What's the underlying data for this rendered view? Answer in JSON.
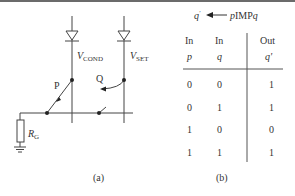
{
  "figure": {
    "panel_a": {
      "caption": "(a)",
      "labels": {
        "v_cond_main": "V",
        "v_cond_sub": "COND",
        "v_set_main": "V",
        "v_set_sub": "SET",
        "switch_p": "P",
        "switch_q": "Q",
        "resistor_main": "R",
        "resistor_sub": "G"
      }
    },
    "panel_b": {
      "caption": "(b)",
      "title": {
        "output": "q",
        "output_prime": "'",
        "expr_p": "p",
        "expr_op": "IMP",
        "expr_sub": "q"
      },
      "headers": [
        {
          "top": "In",
          "bottom": "p"
        },
        {
          "top": "In",
          "bottom": "q"
        },
        {
          "top": "Out",
          "bottom": "q'"
        }
      ],
      "rows": [
        [
          "0",
          "0",
          "1"
        ],
        [
          "0",
          "1",
          "1"
        ],
        [
          "1",
          "0",
          "0"
        ],
        [
          "1",
          "1",
          "1"
        ]
      ]
    }
  }
}
